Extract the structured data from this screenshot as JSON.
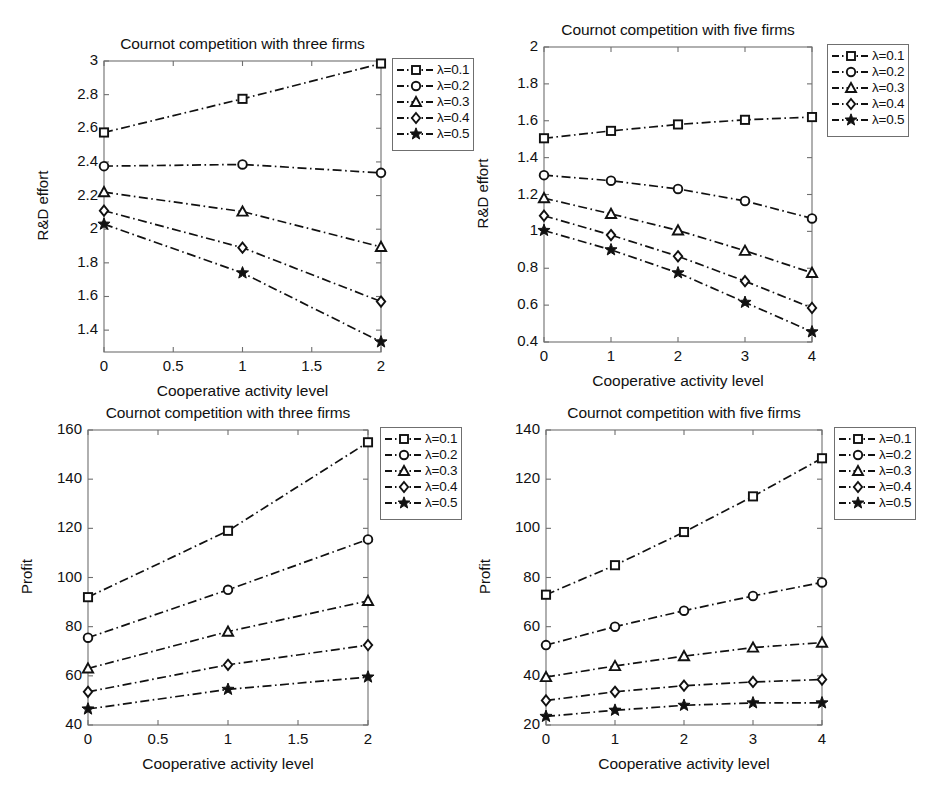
{
  "figure": {
    "background": "#ffffff",
    "line_color": "#111111",
    "axis_color": "#6f6f6f",
    "panel_count": 4
  },
  "legend_common": {
    "entries": [
      {
        "label": "λ=0.1",
        "marker": "square"
      },
      {
        "label": "λ=0.2",
        "marker": "circle"
      },
      {
        "label": "λ=0.3",
        "marker": "triangle"
      },
      {
        "label": "λ=0.4",
        "marker": "diamond"
      },
      {
        "label": "λ=0.5",
        "marker": "star"
      }
    ]
  },
  "chart_data": [
    {
      "id": "top-left",
      "type": "line",
      "title": "Cournot competition with three firms",
      "xlabel": "Cooperative activity level",
      "ylabel": "R&D effort",
      "x": [
        0,
        1,
        2
      ],
      "xlim": [
        0,
        2
      ],
      "ylim": [
        1.27,
        3.0
      ],
      "xticks": [
        0,
        0.5,
        1,
        1.5,
        2
      ],
      "xtick_labels": [
        "0",
        "0.5",
        "1",
        "1.5",
        "2"
      ],
      "yticks": [
        1.4,
        1.6,
        1.8,
        2.0,
        2.2,
        2.4,
        2.6,
        2.8,
        3.0
      ],
      "ytick_labels": [
        "1.4",
        "1.6",
        "1.8",
        "2",
        "2.2",
        "2.4",
        "2.6",
        "2.8",
        "3"
      ],
      "grid": false,
      "legend_position": "outside-top-right",
      "series": [
        {
          "name": "λ=0.1",
          "marker": "square",
          "values": [
            2.575,
            2.775,
            2.985
          ]
        },
        {
          "name": "λ=0.2",
          "marker": "circle",
          "values": [
            2.375,
            2.385,
            2.335
          ]
        },
        {
          "name": "λ=0.3",
          "marker": "triangle",
          "values": [
            2.22,
            2.105,
            1.895
          ]
        },
        {
          "name": "λ=0.4",
          "marker": "diamond",
          "values": [
            2.11,
            1.89,
            1.57
          ]
        },
        {
          "name": "λ=0.5",
          "marker": "star",
          "values": [
            2.03,
            1.74,
            1.33
          ]
        }
      ]
    },
    {
      "id": "top-right",
      "type": "line",
      "title": "Cournot competition with five firms",
      "xlabel": "Cooperative activity level",
      "ylabel": "R&D effort",
      "x": [
        0,
        1,
        2,
        3,
        4
      ],
      "xlim": [
        0,
        4
      ],
      "ylim": [
        0.4,
        2.0
      ],
      "xticks": [
        0,
        1,
        2,
        3,
        4
      ],
      "xtick_labels": [
        "0",
        "1",
        "2",
        "3",
        "4"
      ],
      "yticks": [
        0.4,
        0.6,
        0.8,
        1.0,
        1.2,
        1.4,
        1.6,
        1.8,
        2.0
      ],
      "ytick_labels": [
        "0.4",
        "0.6",
        "0.8",
        "1",
        "1.2",
        "1.4",
        "1.6",
        "1.8",
        "2"
      ],
      "grid": false,
      "legend_position": "outside-top-right",
      "series": [
        {
          "name": "λ=0.1",
          "marker": "square",
          "values": [
            1.505,
            1.545,
            1.58,
            1.605,
            1.62
          ]
        },
        {
          "name": "λ=0.2",
          "marker": "circle",
          "values": [
            1.305,
            1.275,
            1.23,
            1.165,
            1.07
          ]
        },
        {
          "name": "λ=0.3",
          "marker": "triangle",
          "values": [
            1.18,
            1.095,
            1.005,
            0.895,
            0.775
          ]
        },
        {
          "name": "λ=0.4",
          "marker": "diamond",
          "values": [
            1.085,
            0.98,
            0.865,
            0.73,
            0.585
          ]
        },
        {
          "name": "λ=0.5",
          "marker": "star",
          "values": [
            1.005,
            0.9,
            0.775,
            0.615,
            0.455
          ]
        }
      ]
    },
    {
      "id": "bottom-left",
      "type": "line",
      "title": "Cournot competition with three firms",
      "xlabel": "Cooperative activity level",
      "ylabel": "Profit",
      "x": [
        0,
        1,
        2
      ],
      "xlim": [
        0,
        2
      ],
      "ylim": [
        40,
        160
      ],
      "xticks": [
        0,
        0.5,
        1,
        1.5,
        2
      ],
      "xtick_labels": [
        "0",
        "0.5",
        "1",
        "1.5",
        "2"
      ],
      "yticks": [
        40,
        60,
        80,
        100,
        120,
        140,
        160
      ],
      "ytick_labels": [
        "40",
        "60",
        "80",
        "100",
        "120",
        "140",
        "160"
      ],
      "grid": false,
      "legend_position": "outside-top-right",
      "series": [
        {
          "name": "λ=0.1",
          "marker": "square",
          "values": [
            92,
            119,
            155
          ]
        },
        {
          "name": "λ=0.2",
          "marker": "circle",
          "values": [
            75.5,
            95,
            115.5
          ]
        },
        {
          "name": "λ=0.3",
          "marker": "triangle",
          "values": [
            63,
            78,
            90.5
          ]
        },
        {
          "name": "λ=0.4",
          "marker": "diamond",
          "values": [
            53.5,
            64.5,
            72.5
          ]
        },
        {
          "name": "λ=0.5",
          "marker": "star",
          "values": [
            46.5,
            54.5,
            59.5
          ]
        }
      ]
    },
    {
      "id": "bottom-right",
      "type": "line",
      "title": "Cournot competition with five firms",
      "xlabel": "Cooperative activity level",
      "ylabel": "Profit",
      "x": [
        0,
        1,
        2,
        3,
        4
      ],
      "xlim": [
        0,
        4
      ],
      "ylim": [
        20,
        140
      ],
      "xticks": [
        0,
        1,
        2,
        3,
        4
      ],
      "xtick_labels": [
        "0",
        "1",
        "2",
        "3",
        "4"
      ],
      "yticks": [
        20,
        40,
        60,
        80,
        100,
        120,
        140
      ],
      "ytick_labels": [
        "20",
        "40",
        "60",
        "80",
        "100",
        "120",
        "140"
      ],
      "grid": false,
      "legend_position": "outside-top-right",
      "series": [
        {
          "name": "λ=0.1",
          "marker": "square",
          "values": [
            73,
            85,
            98.5,
            113,
            128.5
          ]
        },
        {
          "name": "λ=0.2",
          "marker": "circle",
          "values": [
            52.5,
            60,
            66.5,
            72.5,
            78
          ]
        },
        {
          "name": "λ=0.3",
          "marker": "triangle",
          "values": [
            39.5,
            44,
            48,
            51.5,
            53.5
          ]
        },
        {
          "name": "λ=0.4",
          "marker": "diamond",
          "values": [
            30,
            33.5,
            36,
            37.5,
            38.5
          ]
        },
        {
          "name": "λ=0.5",
          "marker": "star",
          "values": [
            23.5,
            26,
            28,
            29,
            29
          ]
        }
      ]
    }
  ],
  "panels_geometry": [
    {
      "id": "top-left",
      "left": 14,
      "top": 14,
      "width": 455,
      "height": 388,
      "plot": {
        "x": 90,
        "y": 47,
        "w": 277,
        "h": 291
      },
      "legend": {
        "x": 378,
        "y": 44,
        "w": 82,
        "h": 93
      }
    },
    {
      "id": "top-right",
      "left": 479,
      "top": 14,
      "width": 455,
      "height": 388,
      "plot": {
        "x": 65,
        "y": 33,
        "w": 268,
        "h": 295
      },
      "legend": {
        "x": 348,
        "y": 30,
        "w": 82,
        "h": 93
      }
    },
    {
      "id": "bottom-left",
      "left": 14,
      "top": 410,
      "width": 455,
      "height": 388,
      "plot": {
        "x": 74,
        "y": 20,
        "w": 280,
        "h": 295
      },
      "legend": {
        "x": 366,
        "y": 17,
        "w": 82,
        "h": 93
      }
    },
    {
      "id": "bottom-right",
      "left": 479,
      "top": 410,
      "width": 455,
      "height": 388,
      "plot": {
        "x": 67,
        "y": 20,
        "w": 276,
        "h": 295
      },
      "legend": {
        "x": 355,
        "y": 17,
        "w": 82,
        "h": 93
      }
    }
  ]
}
